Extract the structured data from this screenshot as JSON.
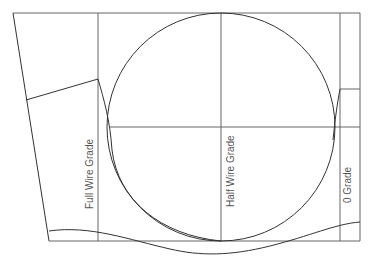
{
  "diagram": {
    "labels": {
      "full_wire": "Full Wire Grade",
      "half_wire": "Half Wire Grade",
      "zero_grade": "0 Grade"
    },
    "colors": {
      "line": "#333333",
      "guide": "#666666",
      "text": "#555555"
    }
  }
}
